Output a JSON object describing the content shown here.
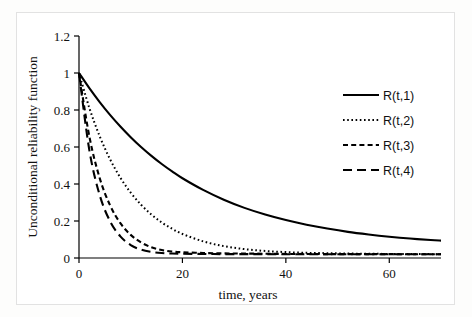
{
  "chart_data": {
    "type": "line",
    "title": "",
    "xlabel": "time, years",
    "ylabel": "Unconditional reliability function",
    "xlim": [
      0,
      70
    ],
    "ylim": [
      0,
      1.2
    ],
    "xticks": [
      0,
      20,
      40,
      60
    ],
    "xtick_labels": [
      "0",
      "20",
      "40",
      "60"
    ],
    "yticks": [
      0,
      0.2,
      0.4,
      0.6,
      0.8,
      1,
      1.2
    ],
    "ytick_labels": [
      "0",
      "0.2",
      "0.4",
      "0.6",
      "0.8",
      "1",
      "1.2"
    ],
    "grid": false,
    "legend_position": "right",
    "x": [
      0,
      2,
      4,
      6,
      8,
      10,
      12,
      14,
      16,
      18,
      20,
      24,
      28,
      32,
      36,
      40,
      44,
      48,
      52,
      56,
      60,
      64,
      68,
      70
    ],
    "series": [
      {
        "name": "R(t,1)",
        "style": "solid",
        "values": [
          1.0,
          0.918,
          0.843,
          0.774,
          0.711,
          0.653,
          0.6,
          0.552,
          0.508,
          0.468,
          0.431,
          0.368,
          0.315,
          0.271,
          0.235,
          0.205,
          0.18,
          0.159,
          0.141,
          0.127,
          0.115,
          0.105,
          0.097,
          0.094
        ]
      },
      {
        "name": "R(t,2)",
        "style": "dotted",
        "values": [
          1.0,
          0.811,
          0.658,
          0.534,
          0.434,
          0.353,
          0.288,
          0.235,
          0.192,
          0.158,
          0.13,
          0.09,
          0.064,
          0.048,
          0.038,
          0.032,
          0.028,
          0.026,
          0.024,
          0.023,
          0.022,
          0.022,
          0.021,
          0.021
        ]
      },
      {
        "name": "R(t,3)",
        "style": "dashed-short",
        "values": [
          1.0,
          0.657,
          0.432,
          0.285,
          0.188,
          0.125,
          0.084,
          0.058,
          0.043,
          0.035,
          0.031,
          0.027,
          0.025,
          0.024,
          0.023,
          0.022,
          0.022,
          0.021,
          0.021,
          0.021,
          0.021,
          0.02,
          0.02,
          0.02
        ]
      },
      {
        "name": "R(t,4)",
        "style": "dashed-long",
        "values": [
          1.0,
          0.583,
          0.34,
          0.199,
          0.117,
          0.07,
          0.045,
          0.033,
          0.027,
          0.024,
          0.023,
          0.022,
          0.021,
          0.021,
          0.021,
          0.02,
          0.02,
          0.02,
          0.02,
          0.02,
          0.02,
          0.02,
          0.02,
          0.02
        ]
      }
    ],
    "legend": [
      {
        "label": "R(t,1)",
        "style": "solid"
      },
      {
        "label": "R(t,2)",
        "style": "dotted"
      },
      {
        "label": "R(t,3)",
        "style": "dashed-short"
      },
      {
        "label": "R(t,4)",
        "style": "dashed-long"
      }
    ]
  }
}
